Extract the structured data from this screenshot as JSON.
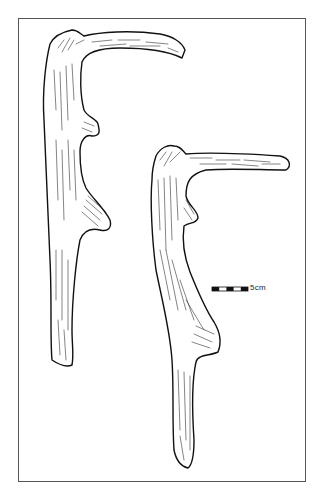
{
  "figure": {
    "specimens": [
      {
        "name": "left-antler"
      },
      {
        "name": "right-antler"
      }
    ],
    "scale_bar": {
      "label": "5cm",
      "segments": 5
    },
    "colors": {
      "line": "#111111",
      "frame": "#555555",
      "background": "#ffffff"
    }
  }
}
